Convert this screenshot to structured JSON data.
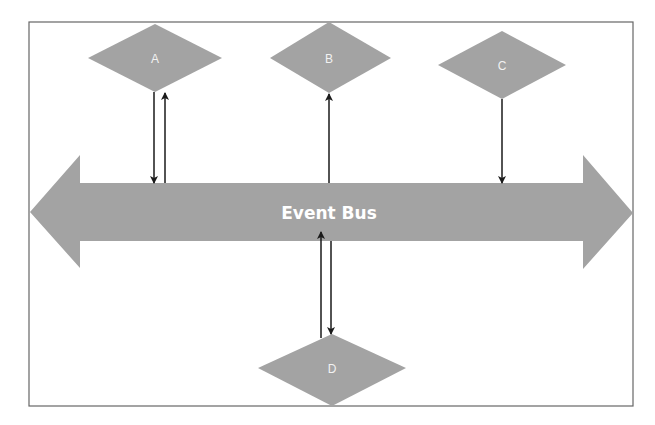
{
  "diagram": {
    "title": "Event Bus",
    "colors": {
      "shape_fill": "#a3a3a3",
      "frame": "#666666",
      "arrow": "#1a1a1a",
      "label": "#f2f2f2"
    },
    "bus": {
      "label": "Event Bus"
    },
    "nodes": [
      {
        "id": "A",
        "label": "A"
      },
      {
        "id": "B",
        "label": "B"
      },
      {
        "id": "C",
        "label": "C"
      },
      {
        "id": "D",
        "label": "D"
      }
    ],
    "connections": [
      {
        "from": "A",
        "to": "Event Bus"
      },
      {
        "from": "Event Bus",
        "to": "A"
      },
      {
        "from": "Event Bus",
        "to": "B"
      },
      {
        "from": "C",
        "to": "Event Bus"
      },
      {
        "from": "D",
        "to": "Event Bus"
      },
      {
        "from": "Event Bus",
        "to": "D"
      }
    ]
  }
}
